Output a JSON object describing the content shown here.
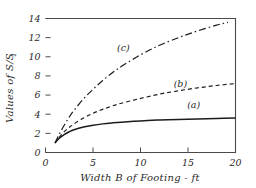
{
  "chart_data": {
    "type": "line",
    "title": "",
    "subtitle": "",
    "xlabel": "Width B of Footing - ft",
    "ylabel": "Values of S/S",
    "ylabel_subscript": "1",
    "xlim": [
      0,
      20
    ],
    "ylim": [
      0,
      14
    ],
    "xticks": [
      0,
      5,
      10,
      15,
      20
    ],
    "xtick_labels": [
      "0",
      "5",
      "10",
      "15",
      "20"
    ],
    "yticks": [
      0,
      2,
      4,
      6,
      8,
      10,
      12,
      14
    ],
    "ytick_labels": [
      "0",
      "2",
      "4",
      "6",
      "8",
      "10",
      "12",
      "14"
    ],
    "grid": false,
    "legend_position": "inline-annotations",
    "series": [
      {
        "name": "(a)",
        "style": "solid",
        "label_x": 15.6,
        "label_y": 4.6,
        "x": [
          1.0,
          1.25,
          1.5,
          2.0,
          2.5,
          3.0,
          4.0,
          5.0,
          6.0,
          7.0,
          8.0,
          10.0,
          12.0,
          14.0,
          16.0,
          18.0,
          20.0
        ],
        "y": [
          1.0,
          1.28,
          1.52,
          1.9,
          2.17,
          2.38,
          2.66,
          2.85,
          2.99,
          3.09,
          3.17,
          3.3,
          3.39,
          3.46,
          3.51,
          3.55,
          3.6
        ]
      },
      {
        "name": "(b)",
        "style": "dashed",
        "label_x": 14.2,
        "label_y": 6.85,
        "x": [
          1.0,
          1.25,
          1.5,
          2.0,
          2.5,
          3.0,
          4.0,
          5.0,
          6.0,
          7.0,
          8.0,
          10.0,
          12.0,
          14.0,
          16.0,
          18.0,
          20.0
        ],
        "y": [
          1.0,
          1.35,
          1.66,
          2.2,
          2.62,
          3.0,
          3.6,
          4.1,
          4.5,
          4.85,
          5.15,
          5.65,
          6.1,
          6.45,
          6.75,
          7.0,
          7.2
        ]
      },
      {
        "name": "(c)",
        "style": "dash-dot",
        "label_x": 8.2,
        "label_y": 10.6,
        "x": [
          1.0,
          1.5,
          2.0,
          2.5,
          3.0,
          4.0,
          5.0,
          6.0,
          7.0,
          8.0,
          10.0,
          12.0,
          14.0,
          16.0,
          18.0,
          19.2
        ],
        "y": [
          1.0,
          2.0,
          2.9,
          3.7,
          4.4,
          5.6,
          6.6,
          7.5,
          8.3,
          9.0,
          10.2,
          11.2,
          12.0,
          12.7,
          13.3,
          13.6
        ]
      }
    ]
  }
}
